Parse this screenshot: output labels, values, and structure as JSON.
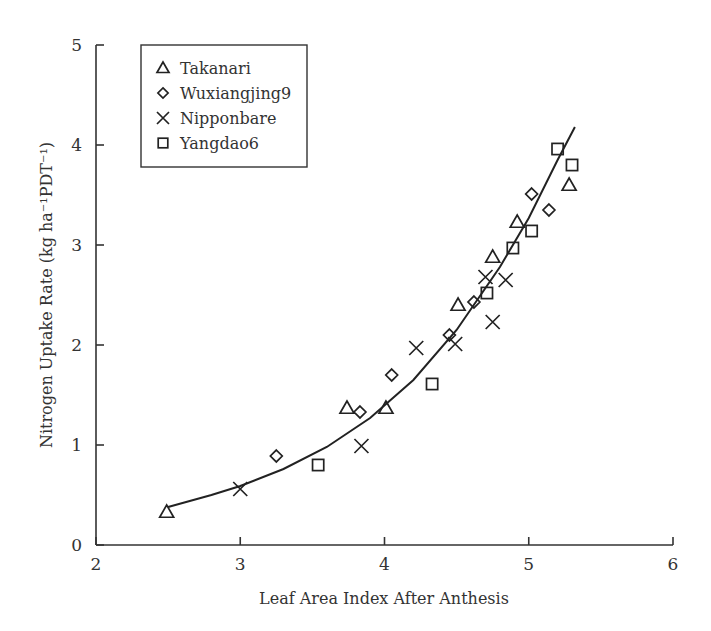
{
  "chart_data": {
    "type": "scatter",
    "title": "",
    "xlabel": "Leaf Area Index After Anthesis",
    "ylabel": "Nitrogen Uptake Rate (kg ha⁻¹PDT⁻¹)",
    "xlim": [
      2,
      6
    ],
    "ylim": [
      0,
      5
    ],
    "xticks": [
      2,
      3,
      4,
      5,
      6
    ],
    "yticks": [
      0,
      1,
      2,
      3,
      4,
      5
    ],
    "grid": false,
    "legend_position": "upper left",
    "series": [
      {
        "name": "Takanari",
        "marker": "triangle",
        "x": [
          2.49,
          3.74,
          4.01,
          4.51,
          4.75,
          4.92,
          5.28
        ],
        "y": [
          0.33,
          1.37,
          1.37,
          2.4,
          2.88,
          3.23,
          3.6
        ]
      },
      {
        "name": "Wuxiangjing9",
        "marker": "diamond",
        "x": [
          3.25,
          3.83,
          4.05,
          4.45,
          4.62,
          5.02,
          5.14
        ],
        "y": [
          0.89,
          1.33,
          1.7,
          2.1,
          2.43,
          3.51,
          3.35
        ]
      },
      {
        "name": "Nipponbare",
        "marker": "x",
        "x": [
          3.0,
          3.84,
          4.22,
          4.49,
          4.7,
          4.75,
          4.84
        ],
        "y": [
          0.56,
          0.99,
          1.97,
          2.01,
          2.68,
          2.23,
          2.65
        ]
      },
      {
        "name": "Yangdao6",
        "marker": "square",
        "x": [
          3.54,
          4.33,
          4.71,
          4.89,
          5.02,
          5.2,
          5.3
        ],
        "y": [
          0.8,
          1.61,
          2.52,
          2.97,
          3.14,
          3.96,
          3.8
        ]
      }
    ],
    "fit_curve": {
      "type": "exponential",
      "x": [
        2.5,
        2.8,
        3.0,
        3.3,
        3.6,
        3.9,
        4.2,
        4.5,
        4.8,
        5.0,
        5.2,
        5.32
      ],
      "y": [
        0.38,
        0.5,
        0.59,
        0.76,
        0.98,
        1.27,
        1.65,
        2.15,
        2.78,
        3.27,
        3.85,
        4.18
      ]
    }
  }
}
